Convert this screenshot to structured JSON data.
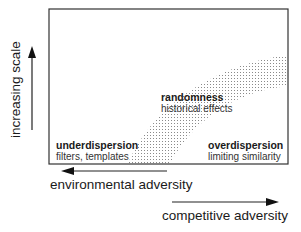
{
  "diagram": {
    "y_axis": {
      "label": "increasing scale",
      "direction": "up"
    },
    "x_axis_left": {
      "label": "environmental adversity",
      "direction": "left"
    },
    "x_axis_right": {
      "label": "competitive adversity",
      "direction": "right"
    },
    "regions": [
      {
        "id": "underdispersion",
        "title": "underdispersion",
        "subtitle": "filters, templates"
      },
      {
        "id": "randomness",
        "title": "randomness",
        "subtitle": "historical effects"
      },
      {
        "id": "overdispersion",
        "title": "overdispersion",
        "subtitle": "limiting similarity"
      }
    ],
    "colors": {
      "line": "#222222",
      "stipple": "#9a9a9a",
      "background": "#ffffff"
    }
  }
}
